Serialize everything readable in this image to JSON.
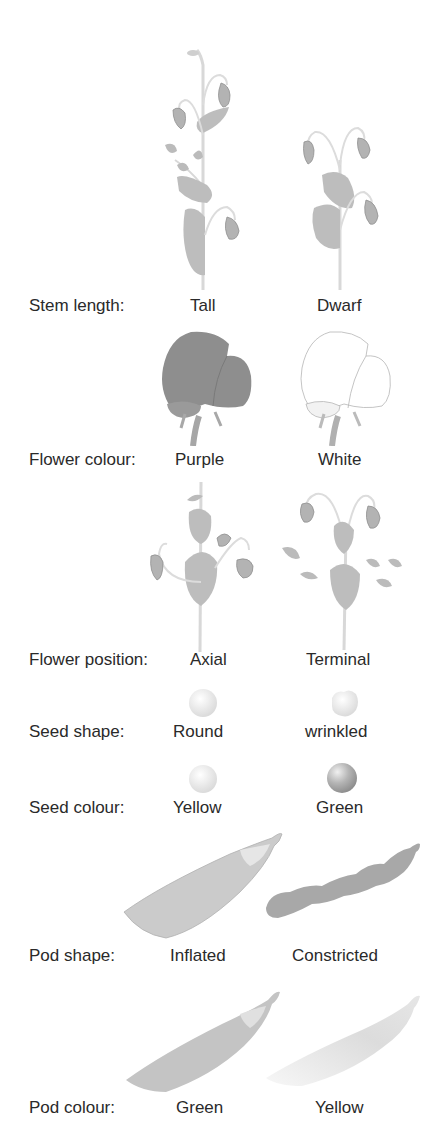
{
  "figure": {
    "type": "mendel-pea-traits",
    "colors": {
      "plant_fill": "#b8b8b8",
      "plant_stroke": "#9a9a9a",
      "stem": "#e6e6e6",
      "purple_flower": "#8c8c8c",
      "white_flower": "#ffffff",
      "label_text": "#2a2a2a"
    },
    "traits": [
      {
        "label": "Stem length:",
        "dominant": "Tall",
        "recessive": "Dwarf"
      },
      {
        "label": "Flower colour:",
        "dominant": "Purple",
        "recessive": "White"
      },
      {
        "label": "Flower position:",
        "dominant": "Axial",
        "recessive": "Terminal"
      },
      {
        "label": "Seed shape:",
        "dominant": "Round",
        "recessive": "wrinkled"
      },
      {
        "label": "Seed colour:",
        "dominant": "Yellow",
        "recessive": "Green"
      },
      {
        "label": "Pod shape:",
        "dominant": "Inflated",
        "recessive": "Constricted"
      },
      {
        "label": "Pod colour:",
        "dominant": "Green",
        "recessive": "Yellow"
      }
    ]
  }
}
